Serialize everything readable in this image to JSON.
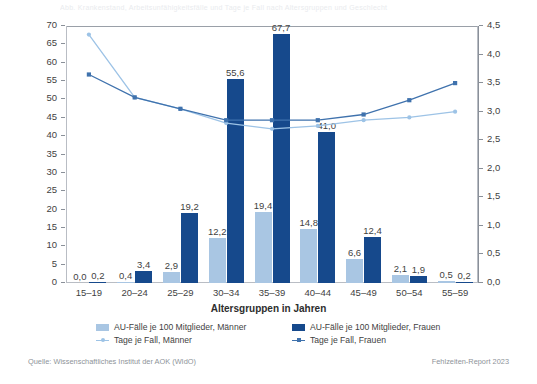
{
  "ghost_caption": "Abb. Krankenstand, Arbeitsunfähigkeitsfälle und Tage je Fall nach Altersgruppen und Geschlecht",
  "chart_data": {
    "type": "bar",
    "title": "",
    "xlabel": "Altersgruppen in Jahren",
    "ylabel": "",
    "categories": [
      "15–19",
      "20–24",
      "25–29",
      "30–34",
      "35–39",
      "40–44",
      "45–49",
      "50–54",
      "55–59"
    ],
    "left_axis": {
      "ylim": [
        0,
        70
      ],
      "ticks": [
        "0",
        "5",
        "10",
        "15",
        "20",
        "25",
        "30",
        "35",
        "40",
        "45",
        "50",
        "55",
        "60",
        "65",
        "70"
      ],
      "tick_values": [
        0,
        5,
        10,
        15,
        20,
        25,
        30,
        35,
        40,
        45,
        50,
        55,
        60,
        65,
        70
      ]
    },
    "right_axis": {
      "ylim": [
        0,
        4.5
      ],
      "ticks": [
        "0,0",
        "0,5",
        "1,0",
        "1,5",
        "2,0",
        "2,5",
        "3,0",
        "3,5",
        "4,0",
        "4,5"
      ],
      "tick_values": [
        0,
        0.5,
        1.0,
        1.5,
        2.0,
        2.5,
        3.0,
        3.5,
        4.0,
        4.5
      ]
    },
    "grid": false,
    "legend_position": "bottom",
    "series": [
      {
        "name": "AU-Fälle je 100 Mitglieder, Männer",
        "kind": "bar",
        "axis": "left",
        "color": "#a9c6e3",
        "values": [
          0.0,
          0.4,
          2.9,
          12.2,
          19.4,
          14.8,
          6.6,
          2.1,
          0.5
        ],
        "labels": [
          "0,0",
          "0,4",
          "2,9",
          "12,2",
          "19,4",
          "14,8",
          "6,6",
          "2,1",
          "0,5"
        ]
      },
      {
        "name": "AU-Fälle je 100 Mitglieder, Frauen",
        "kind": "bar",
        "axis": "left",
        "color": "#16498c",
        "values": [
          0.2,
          3.4,
          19.2,
          55.6,
          67.7,
          41.0,
          12.4,
          1.9,
          0.2
        ],
        "labels": [
          "0,2",
          "3,4",
          "19,2",
          "55,6",
          "67,7",
          "41,0",
          "12,4",
          "1,9",
          "0,2"
        ]
      },
      {
        "name": "Tage je Fall, Männer",
        "kind": "line",
        "axis": "right",
        "color": "#9dc3e6",
        "values": [
          4.35,
          3.25,
          3.05,
          2.8,
          2.7,
          2.75,
          2.85,
          2.9,
          3.0
        ]
      },
      {
        "name": "Tage je Fall, Frauen",
        "kind": "line",
        "axis": "right",
        "color": "#3f72ad",
        "values": [
          3.65,
          3.25,
          3.05,
          2.85,
          2.85,
          2.85,
          2.95,
          3.2,
          3.5
        ]
      }
    ]
  },
  "legend": [
    {
      "label": "AU-Fälle je 100 Mitglieder, Männer",
      "swatch": "bar-male"
    },
    {
      "label": "AU-Fälle je 100 Mitglieder, Frauen",
      "swatch": "bar-female"
    },
    {
      "label": "Tage je Fall, Männer",
      "swatch": "line-male"
    },
    {
      "label": "Tage je Fall, Frauen",
      "swatch": "line-female"
    }
  ],
  "footer": {
    "source": "Quelle: Wissenschaftliches Institut der AOK (WIdO)",
    "report": "Fehlzeiten-Report 2023"
  },
  "colors": {
    "bar_male": "#a9c6e3",
    "bar_female": "#16498c",
    "line_male": "#9dc3e6",
    "line_female": "#3f72ad",
    "axis": "#8a9099",
    "text": "#3f3f3f"
  }
}
